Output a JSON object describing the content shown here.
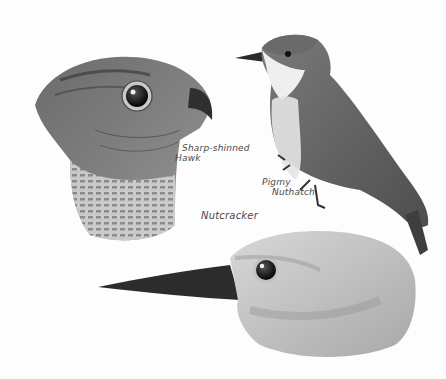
{
  "illustration": {
    "style": "pencil and watercolor bird sketch, grayscale",
    "background_color": "#fdfdfd",
    "ink_color": "#4a4a4a",
    "birds": [
      {
        "id": "hawk",
        "label_lines": [
          "Sharp-shinned",
          "Hawk"
        ]
      },
      {
        "id": "nuthatch",
        "label_lines": [
          "Pigmy",
          "Nuthatch"
        ]
      },
      {
        "id": "nutcracker",
        "label_lines": [
          "Nutcracker"
        ]
      }
    ]
  }
}
